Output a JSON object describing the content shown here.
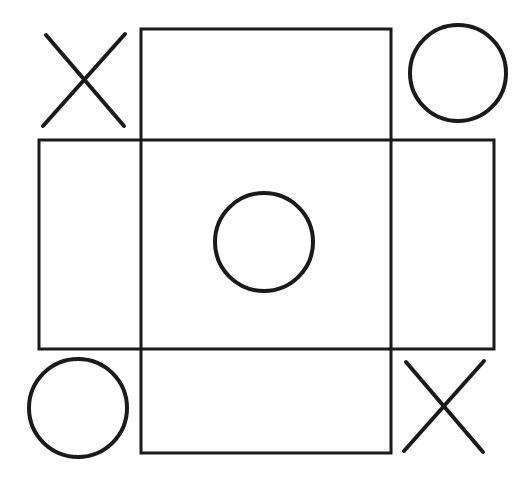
{
  "diagram": {
    "stroke_color": "#1a1a1a",
    "background": "#ffffff",
    "shapes": {
      "vertical_rect": {
        "x": 141,
        "y": 29,
        "w": 250,
        "h": 424
      },
      "horizontal_rect": {
        "x": 39,
        "y": 140,
        "w": 455,
        "h": 209
      }
    },
    "marks": [
      {
        "type": "X",
        "position": "top-left",
        "x1": 45,
        "y1": 34,
        "x2": 125,
        "y2": 126
      },
      {
        "type": "O",
        "position": "top-right",
        "cx": 458,
        "cy": 73,
        "r": 48
      },
      {
        "type": "O",
        "position": "center",
        "cx": 264,
        "cy": 242,
        "r": 49
      },
      {
        "type": "O",
        "position": "bottom-left",
        "cx": 78,
        "cy": 408,
        "r": 49
      },
      {
        "type": "X",
        "position": "bottom-right",
        "x1": 404,
        "y1": 361,
        "x2": 484,
        "y2": 451
      }
    ]
  }
}
